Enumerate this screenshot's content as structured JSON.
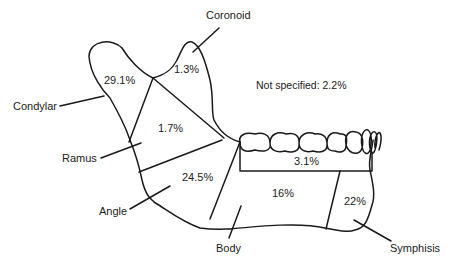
{
  "figure": {
    "not_specified": "Not specified: 2.2%"
  },
  "labels": {
    "coronoid": "Coronoid",
    "condylar": "Condylar",
    "ramus": "Ramus",
    "angle": "Angle",
    "body": "Body",
    "symphisis": "Symphisis"
  },
  "percents": {
    "condylar": "29.1%",
    "coronoid": "1.3%",
    "ramus": "1.7%",
    "angle": "24.5%",
    "alveolar": "3.1%",
    "body": "16%",
    "symphisis": "22%"
  },
  "colors": {
    "line": "#1a1a1a",
    "background": "#ffffff"
  }
}
